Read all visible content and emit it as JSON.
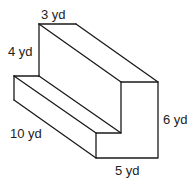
{
  "figure": {
    "labels": {
      "top_width": "3 yd",
      "upper_height": "4 yd",
      "depth": "10 yd",
      "bottom_width": "5 yd",
      "total_height": "6 yd"
    }
  }
}
